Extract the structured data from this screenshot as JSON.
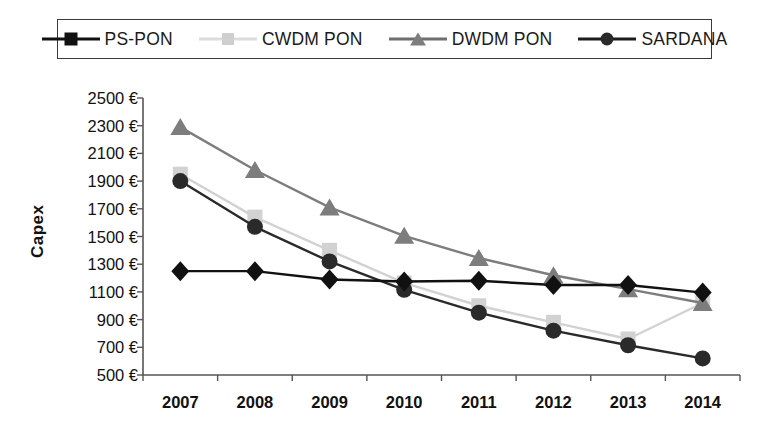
{
  "legend": {
    "position": "top",
    "items": [
      {
        "label": "PS-PON",
        "marker": "diamond-icon",
        "color": "#111111",
        "line_color": "#111111"
      },
      {
        "label": "CWDM PON",
        "marker": "square-icon",
        "color": "#d2d2d2",
        "line_color": "#d9d9d9"
      },
      {
        "label": "DWDM PON",
        "marker": "triangle-icon",
        "color": "#7d7d7d",
        "line_color": "#6f6f6f"
      },
      {
        "label": "SARDANA",
        "marker": "circle-icon",
        "color": "#2a2a2a",
        "line_color": "#1c1c1c"
      }
    ]
  },
  "chart_data": {
    "type": "line",
    "title": "",
    "xlabel": "",
    "ylabel": "Capex",
    "categories": [
      "2007",
      "2008",
      "2009",
      "2010",
      "2011",
      "2012",
      "2013",
      "2014"
    ],
    "x": [
      2007,
      2008,
      2009,
      2010,
      2011,
      2012,
      2013,
      2014
    ],
    "ylim": [
      500,
      2500
    ],
    "yticks": [
      500,
      700,
      900,
      1100,
      1300,
      1500,
      1700,
      1900,
      2100,
      2300,
      2500
    ],
    "ytick_labels": [
      "500 €",
      "700 €",
      "900 €",
      "1100 €",
      "1300 €",
      "1500 €",
      "1700 €",
      "1900 €",
      "2100 €",
      "2300 €",
      "2500 €"
    ],
    "ytick_suffix": " €",
    "grid": false,
    "legend_position": "top",
    "series": [
      {
        "name": "PS-PON",
        "marker": "diamond",
        "color": "#111111",
        "values": [
          1250,
          1250,
          1190,
          1175,
          1180,
          1150,
          1150,
          1095
        ]
      },
      {
        "name": "CWDM PON",
        "marker": "square",
        "color": "#d2d2d2",
        "values": [
          1950,
          1640,
          1400,
          1165,
          1000,
          880,
          760,
          1020
        ]
      },
      {
        "name": "DWDM PON",
        "marker": "triangle",
        "color": "#7d7d7d",
        "values": [
          2290,
          1980,
          1710,
          1505,
          1345,
          1220,
          1120,
          1020
        ]
      },
      {
        "name": "SARDANA",
        "marker": "circle",
        "color": "#2a2a2a",
        "values": [
          1900,
          1570,
          1320,
          1115,
          950,
          820,
          715,
          620
        ]
      }
    ]
  },
  "axis": {
    "y_title": "Capex"
  }
}
